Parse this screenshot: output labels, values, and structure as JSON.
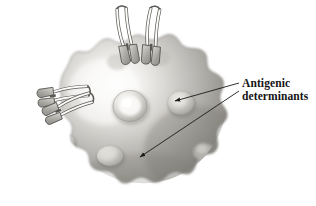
{
  "figure": {
    "background_color": "#ffffff",
    "width": 316,
    "height": 206
  },
  "label": {
    "line1": "Antigenic",
    "line2": "determinants",
    "color": "#131313"
  },
  "leader_lines": [
    {
      "name": "leader-line-upper",
      "from": [
        240,
        83
      ],
      "to": [
        172,
        101
      ],
      "arrow": "to-target"
    },
    {
      "name": "leader-line-lower",
      "from": [
        240,
        90
      ],
      "to": [
        137,
        158
      ],
      "arrow": "to-target"
    }
  ],
  "cell": {
    "name": "antigen-cell-body",
    "fill_light": "#f2f1ef",
    "fill_mid": "#b4b2ae",
    "fill_dark": "#7e7c78",
    "outline": "#6a6865"
  },
  "determinants": [
    {
      "name": "determinant-center",
      "cx": 130,
      "cy": 106,
      "rx": 17,
      "ry": 15
    },
    {
      "name": "determinant-right",
      "cx": 181,
      "cy": 103,
      "rx": 13,
      "ry": 12
    },
    {
      "name": "determinant-lower-left",
      "cx": 110,
      "cy": 156,
      "rx": 13,
      "ry": 10
    },
    {
      "name": "determinant-far-left",
      "cx": 68,
      "cy": 143,
      "rx": 8,
      "ry": 7
    },
    {
      "name": "determinant-lower-right",
      "cx": 204,
      "cy": 152,
      "rx": 11,
      "ry": 9
    }
  ],
  "antibodies": [
    {
      "name": "antibody-top-left",
      "position": "top",
      "angle": -6
    },
    {
      "name": "antibody-top-right",
      "position": "top",
      "angle": 6
    },
    {
      "name": "antibody-left-upper",
      "position": "left",
      "angle": -38
    },
    {
      "name": "antibody-left-lower",
      "position": "left",
      "angle": -26
    }
  ],
  "colors": {
    "antibody_fill": "#fbfbfa",
    "antibody_shade": "#a6a4a0",
    "antibody_stroke": "#55534f",
    "leader_stroke": "#1a1a1a"
  }
}
